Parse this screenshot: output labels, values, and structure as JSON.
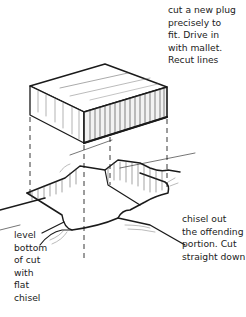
{
  "figure": {
    "type": "hand-drawn woodworking illustration",
    "captions": {
      "top": "cut a new plug\nprecisely to\nfit. Drive in\nwith mallet.\nRecut lines",
      "right": "chisel out\nthe offending\nportion. Cut\nstraight down",
      "left": "level\nbottom\nof cut\nwith\nflat\nchisel"
    },
    "parts": [
      "new-plug-block",
      "projection-guide-lines",
      "chiseled-recess",
      "board-surface"
    ]
  }
}
